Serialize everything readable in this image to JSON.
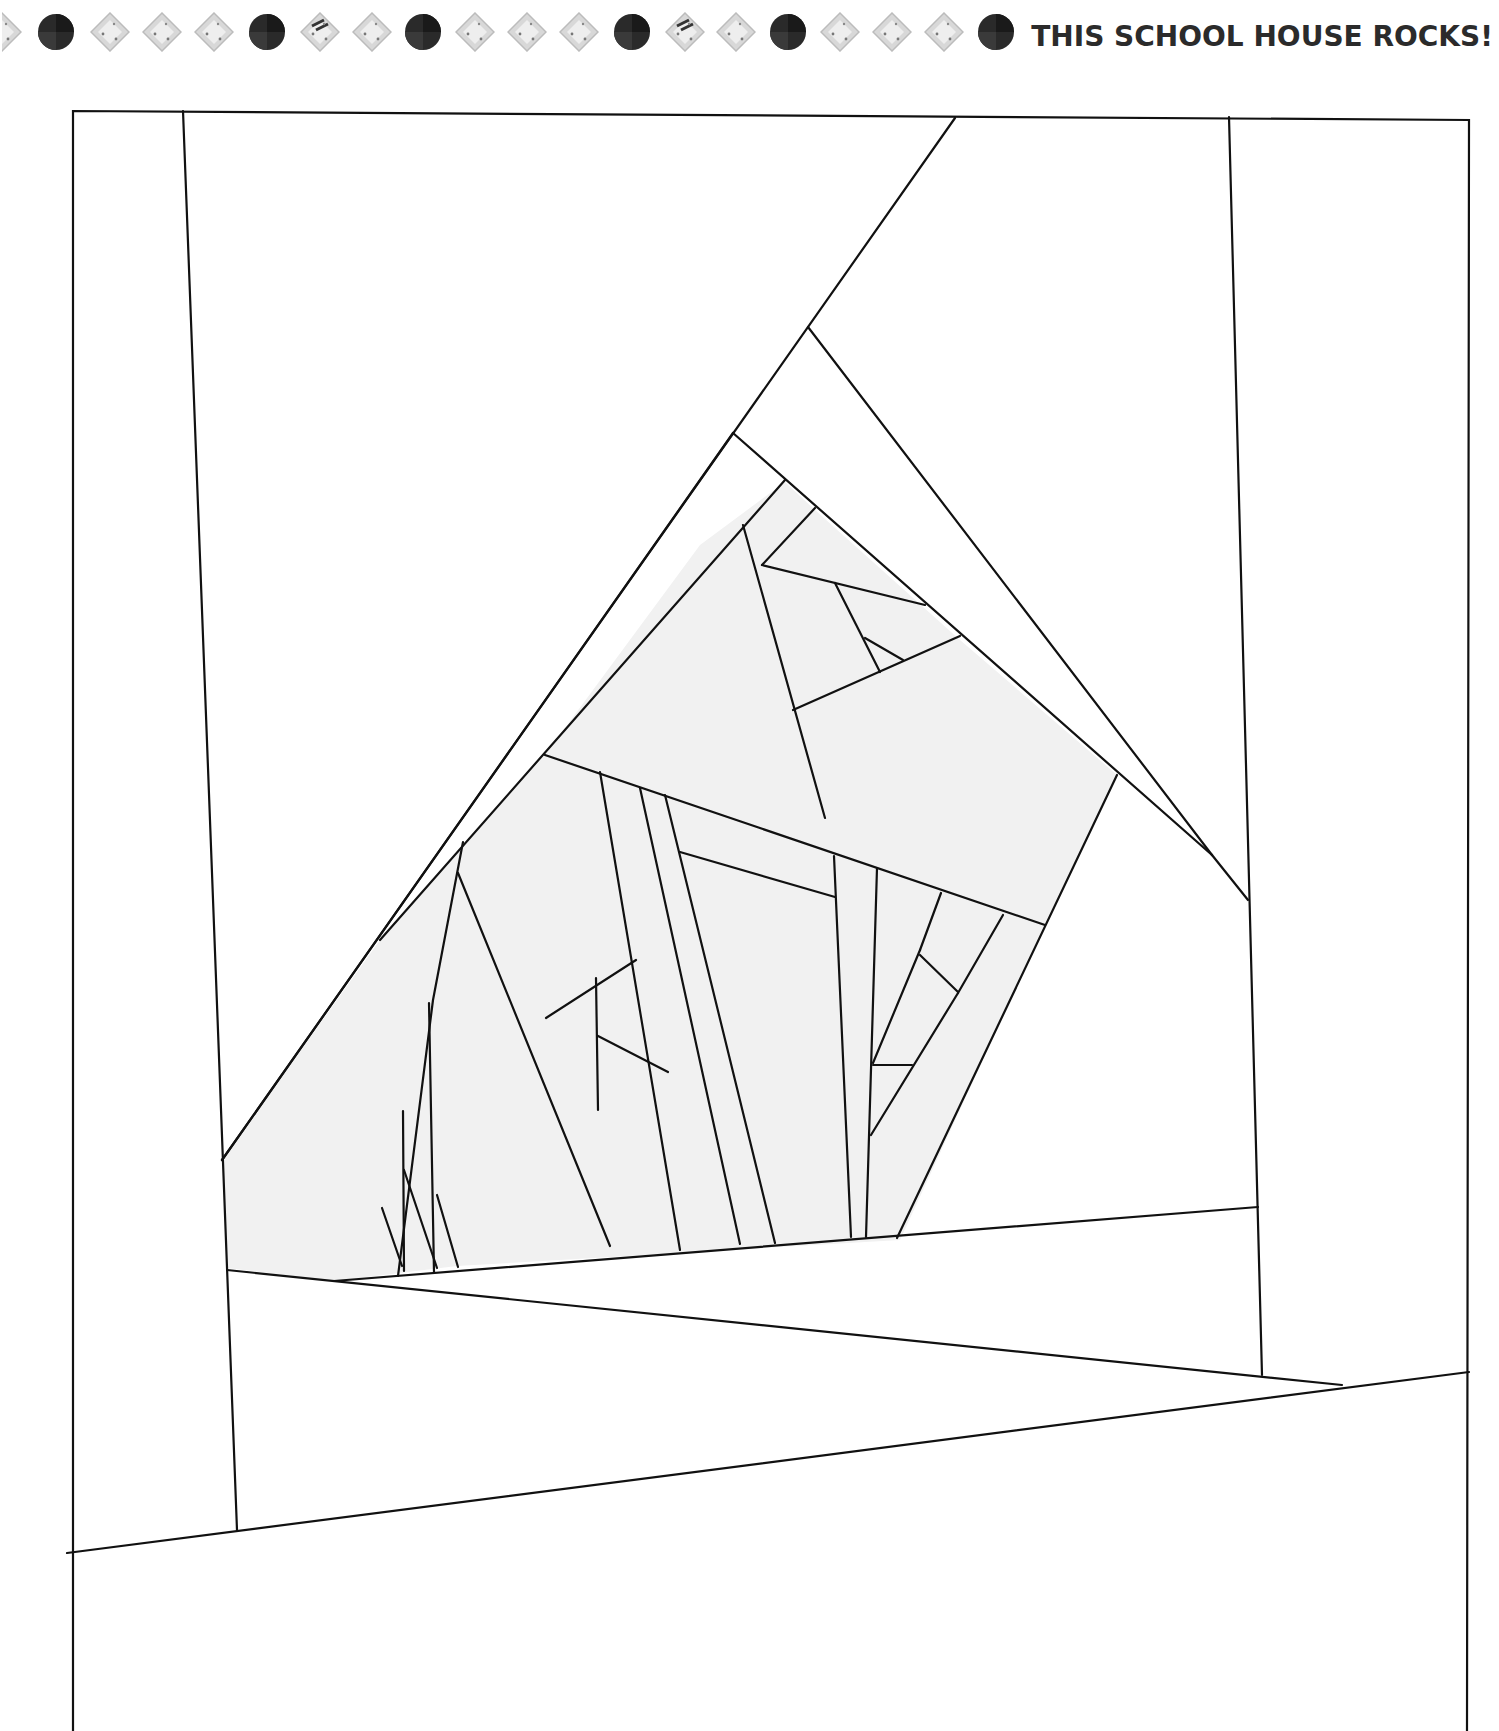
{
  "header": {
    "title": "THIS SCHOOL HOUSE ROCKS!",
    "border_gems": [
      "half-diamond",
      "dark-circle",
      "diamond",
      "diamond",
      "diamond",
      "dark-circle",
      "striped-diamond",
      "diamond",
      "dark-circle",
      "diamond",
      "diamond",
      "diamond",
      "dark-circle",
      "striped-diamond",
      "diamond",
      "dark-circle",
      "diamond",
      "diamond",
      "diamond",
      "dark-circle"
    ]
  },
  "pattern": {
    "description": "Foundation paper piecing template — house/rooftop block",
    "shade_color": "#f1f1f1",
    "line_color": "#111111"
  }
}
